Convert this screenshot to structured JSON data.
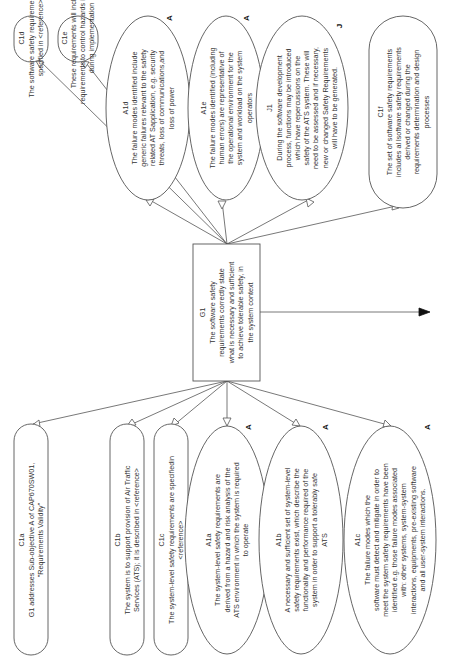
{
  "diagram": {
    "type": "goal-structuring-notation",
    "orientation": "rotated-90-ccw",
    "colors": {
      "stroke": "#555555",
      "text": "#333333",
      "background": "#ffffff"
    },
    "goal": {
      "id": "G1",
      "lines": [
        "G1",
        "The software safety",
        "requirements correctly state",
        "what is necessary and sufficient",
        "to achieve tolerable safety, in",
        "the system context"
      ]
    },
    "top_nodes": [
      {
        "id": "C1d",
        "kind": "context",
        "lines": [
          "C1d",
          "The software safety requirements are",
          "specified in <reference>"
        ]
      },
      {
        "id": "C1e",
        "kind": "context",
        "lines": [
          "C1e",
          "These requirements will include",
          "requirements to control hazards identified",
          "during implementation"
        ]
      },
      {
        "id": "A1d",
        "kind": "assumption",
        "tag": "A",
        "lines": [
          "A1d",
          "The failure modes identified include",
          "generic failures relevant to the safety",
          "related AT Sapplication, e.g. security",
          "threats, loss of communications,and",
          "loss of power"
        ]
      },
      {
        "id": "A1e",
        "kind": "assumption",
        "tag": "A",
        "lines": [
          "A1e",
          "The failure modes identified (including",
          "human errors) are representative of",
          "the operational environment for the",
          "system and workload on the system",
          "operators"
        ]
      },
      {
        "id": "J1",
        "kind": "justification",
        "tag": "J",
        "lines": [
          "J1",
          "During the software development",
          "process, functions may be introduced",
          "which have repercussions on the",
          "safety of the ATS system. These will",
          "need to be assessed and if necessary,",
          "new or changed Safety Requirements",
          "will have to be generated."
        ]
      },
      {
        "id": "C1f",
        "kind": "context",
        "lines": [
          "C1f",
          "The set of software safety requirements",
          "includes al lsoftware safety requirements",
          "derived or changed during the",
          "requirements determination and design",
          "processes"
        ]
      }
    ],
    "bottom_nodes": [
      {
        "id": "C1a",
        "kind": "context",
        "lines": [
          "C1a",
          "G1 addresses Sub-objective A of CAP670SW01,",
          "\"Requirements Validity\""
        ]
      },
      {
        "id": "C1b",
        "kind": "context",
        "lines": [
          "C1b",
          "The system is to support provision of Air Traffic",
          "Services (ATS); it is described in <reference>"
        ]
      },
      {
        "id": "C1c",
        "kind": "context",
        "lines": [
          "C1c",
          "The system-level safety requirements are specifiedin",
          "<reference>"
        ]
      },
      {
        "id": "A1a",
        "kind": "assumption",
        "tag": "A",
        "lines": [
          "A1a",
          "The system-level safety requirements are",
          "derived from a hazard and risk analysis of the",
          "ATS environment in which the system is required",
          "to operate"
        ]
      },
      {
        "id": "A1b",
        "kind": "assumption",
        "tag": "A",
        "lines": [
          "A1b",
          "A necessary and sufficient set of system-level",
          "safety requirements exist, which describe the",
          "functionality and performance required of the",
          "system in order to support a tolerably safe",
          "ATS"
        ]
      },
      {
        "id": "A1c",
        "kind": "assumption",
        "tag": "A",
        "lines": [
          "A1c",
          "The failure modes which the",
          "software must detect and mitigate in order to",
          "meet the system safety requirements have been",
          "identified e.g. those failure modes associated",
          "with: other systems, system-system",
          "interactions, equipments, pre-existing software",
          "and all user-system interactions."
        ]
      }
    ]
  }
}
